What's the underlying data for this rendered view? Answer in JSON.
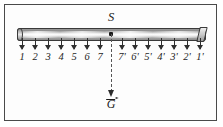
{
  "figure": {
    "caption_title": "Loaded beam suspended at point S",
    "frame": {
      "border_color": "#4a4a4a",
      "background_color": "#fdfdfd"
    },
    "beam": {
      "name": "horizontal-beam",
      "fill_color": "#bdbdbd",
      "outline_color": "#3a3a3a"
    },
    "pivot": {
      "label": "S",
      "description": "suspension point"
    },
    "weight_vector": {
      "label": "G",
      "has_vector_arrow": true,
      "direction": "downward",
      "line_style": "dashed",
      "line_color": "#555555"
    },
    "left_labels": [
      "1",
      "2",
      "3",
      "4",
      "5",
      "6",
      "7"
    ],
    "right_labels": [
      "7'",
      "6'",
      "5'",
      "4'",
      "3'",
      "2'",
      "1'"
    ]
  },
  "chart_data": {
    "type": "diagram",
    "positions": [
      {
        "label": "1",
        "side": "left",
        "x_px": 22,
        "force": "down"
      },
      {
        "label": "2",
        "side": "left",
        "x_px": 35,
        "force": "down"
      },
      {
        "label": "3",
        "side": "left",
        "x_px": 48,
        "force": "down"
      },
      {
        "label": "4",
        "side": "left",
        "x_px": 61,
        "force": "down"
      },
      {
        "label": "5",
        "side": "left",
        "x_px": 74,
        "force": "down"
      },
      {
        "label": "6",
        "side": "left",
        "x_px": 87,
        "force": "down"
      },
      {
        "label": "7",
        "side": "left",
        "x_px": 100,
        "force": "down"
      },
      {
        "label": "7'",
        "side": "right",
        "x_px": 122,
        "force": "down"
      },
      {
        "label": "6'",
        "side": "right",
        "x_px": 135,
        "force": "down"
      },
      {
        "label": "5'",
        "side": "right",
        "x_px": 148,
        "force": "down"
      },
      {
        "label": "4'",
        "side": "right",
        "x_px": 161,
        "force": "down"
      },
      {
        "label": "3'",
        "side": "right",
        "x_px": 174,
        "force": "down"
      },
      {
        "label": "2'",
        "side": "right",
        "x_px": 187,
        "force": "down"
      },
      {
        "label": "1'",
        "side": "right",
        "x_px": 200,
        "force": "down"
      }
    ],
    "annotations": [
      {
        "text": "S",
        "role": "pivot-point",
        "x_px": 111,
        "y_px": 16
      },
      {
        "text": "G",
        "role": "weight-vector",
        "x_px": 111,
        "y_px": 104
      }
    ]
  }
}
